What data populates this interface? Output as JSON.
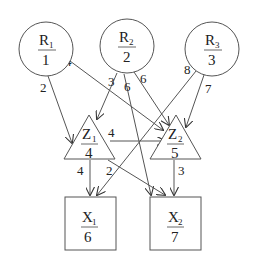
{
  "diagram": {
    "type": "network-flow",
    "nodes": [
      {
        "id": "R1",
        "shape": "circle",
        "letter": "R",
        "sub": "1",
        "value": "1",
        "cx": 46,
        "cy": 49,
        "r": 27
      },
      {
        "id": "R2",
        "shape": "circle",
        "letter": "R",
        "sub": "2",
        "value": "2",
        "cx": 127,
        "cy": 46,
        "r": 27
      },
      {
        "id": "R3",
        "shape": "circle",
        "letter": "R",
        "sub": "3",
        "value": "3",
        "cx": 212,
        "cy": 49,
        "r": 27
      },
      {
        "id": "Z1",
        "shape": "triangle",
        "letter": "Z",
        "sub": "1",
        "value": "4",
        "apex": [
          89,
          115
        ],
        "base": [
          [
            64,
            159
          ],
          [
            115,
            159
          ]
        ]
      },
      {
        "id": "Z2",
        "shape": "triangle",
        "letter": "Z",
        "sub": "2",
        "value": "5",
        "apex": [
          176,
          115
        ],
        "base": [
          [
            150,
            159
          ],
          [
            201,
            159
          ]
        ]
      },
      {
        "id": "X1",
        "shape": "square",
        "letter": "X",
        "sub": "1",
        "value": "6",
        "x": 65,
        "y": 197,
        "w": 51,
        "h": 53
      },
      {
        "id": "X2",
        "shape": "square",
        "letter": "X",
        "sub": "2",
        "value": "7",
        "x": 150,
        "y": 197,
        "w": 51,
        "h": 53
      }
    ],
    "edges": [
      {
        "from": "R1",
        "to": "Z1",
        "label": "2"
      },
      {
        "from": "R1",
        "to": "Z2",
        "label": "4"
      },
      {
        "from": "R2",
        "to": "Z1",
        "label": "3"
      },
      {
        "from": "R2",
        "to": "X2",
        "label": "6"
      },
      {
        "from": "R2",
        "to": "Z2",
        "label": "6"
      },
      {
        "from": "R3",
        "to": "X1",
        "label": "8"
      },
      {
        "from": "R3",
        "to": "Z2",
        "label": "7"
      },
      {
        "from": "Z1",
        "to": "Z2",
        "label": "4"
      },
      {
        "from": "Z1",
        "to": "X1",
        "label": "4"
      },
      {
        "from": "Z1",
        "to": "X2",
        "label": "2"
      },
      {
        "from": "Z2",
        "to": "X2",
        "label": "3"
      }
    ]
  },
  "labels": {
    "R1": {
      "letter": "R",
      "sub": "1",
      "value": "1"
    },
    "R2": {
      "letter": "R",
      "sub": "2",
      "value": "2"
    },
    "R3": {
      "letter": "R",
      "sub": "3",
      "value": "3"
    },
    "Z1": {
      "letter": "Z",
      "sub": "1",
      "value": "4"
    },
    "Z2": {
      "letter": "Z",
      "sub": "2",
      "value": "5"
    },
    "X1": {
      "letter": "X",
      "sub": "1",
      "value": "6"
    },
    "X2": {
      "letter": "X",
      "sub": "2",
      "value": "7"
    },
    "edge_R1_Z1": "2",
    "edge_R1_Z2": "4",
    "edge_R2_Z1": "3",
    "edge_R2_X2": "6",
    "edge_R2_Z2": "6",
    "edge_R3_X1": "8",
    "edge_R3_Z2": "7",
    "edge_Z1_Z2": "4",
    "edge_Z1_X1": "4",
    "edge_Z1_X2": "2",
    "edge_Z2_X2": "3"
  },
  "colors": {
    "line": "#555555",
    "text": "#222222",
    "background": "#ffffff"
  }
}
